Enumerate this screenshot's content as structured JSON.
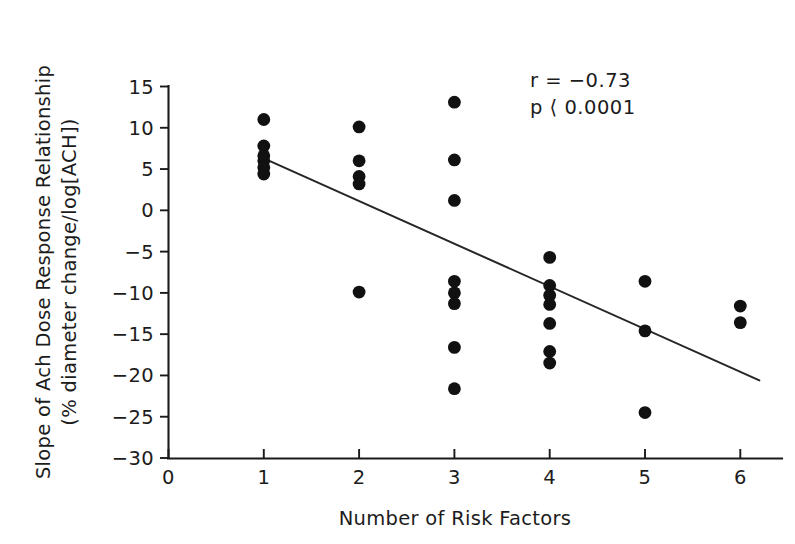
{
  "chart_data": {
    "type": "scatter",
    "title": "",
    "xlabel": "Number of Risk Factors",
    "ylabel": "Slope of Ach Dose Response Relationship (% diameter change/log[ACH])",
    "ylabel_line1": "Slope of Ach Dose Response Relationship",
    "ylabel_line2": "(% diameter change/log[ACH])",
    "xlim": [
      0,
      6.35
    ],
    "ylim": [
      -30,
      15
    ],
    "xticks": [
      0,
      1,
      2,
      3,
      4,
      5,
      6
    ],
    "xtick_labels": [
      "0",
      "1",
      "2",
      "3",
      "4",
      "5",
      "6"
    ],
    "yticks": [
      15,
      10,
      5,
      0,
      -5,
      -10,
      -15,
      -20,
      -25,
      -30
    ],
    "ytick_labels": [
      "15",
      "10",
      "5",
      "0",
      "−5",
      "−10",
      "−15",
      "−20",
      "−25",
      "−30"
    ],
    "grid": false,
    "legend": null,
    "points": [
      {
        "x": 1,
        "y": 11.0
      },
      {
        "x": 1,
        "y": 7.8
      },
      {
        "x": 1,
        "y": 6.6
      },
      {
        "x": 1,
        "y": 6.0
      },
      {
        "x": 1,
        "y": 5.2
      },
      {
        "x": 1,
        "y": 4.4
      },
      {
        "x": 2,
        "y": 10.1
      },
      {
        "x": 2,
        "y": 6.0
      },
      {
        "x": 2,
        "y": 4.1
      },
      {
        "x": 2,
        "y": 3.2
      },
      {
        "x": 2,
        "y": -9.9
      },
      {
        "x": 3,
        "y": 13.1
      },
      {
        "x": 3,
        "y": 6.1
      },
      {
        "x": 3,
        "y": 1.2
      },
      {
        "x": 3,
        "y": -8.6
      },
      {
        "x": 3,
        "y": -10.0
      },
      {
        "x": 3,
        "y": -11.3
      },
      {
        "x": 3,
        "y": -16.6
      },
      {
        "x": 3,
        "y": -21.6
      },
      {
        "x": 4,
        "y": -5.7
      },
      {
        "x": 4,
        "y": -9.1
      },
      {
        "x": 4,
        "y": -10.3
      },
      {
        "x": 4,
        "y": -11.4
      },
      {
        "x": 4,
        "y": -13.7
      },
      {
        "x": 4,
        "y": -17.1
      },
      {
        "x": 4,
        "y": -18.5
      },
      {
        "x": 5,
        "y": -8.6
      },
      {
        "x": 5,
        "y": -14.6
      },
      {
        "x": 5,
        "y": -24.5
      },
      {
        "x": 6,
        "y": -11.6
      },
      {
        "x": 6,
        "y": -13.6
      }
    ],
    "fit_line": {
      "x_start": 1.0,
      "y_start": 6.3,
      "x_end": 6.2,
      "y_end": -20.6
    },
    "annotations": {
      "correlation": "r = −0.73",
      "pvalue": "p ⟨ 0.0001"
    }
  }
}
